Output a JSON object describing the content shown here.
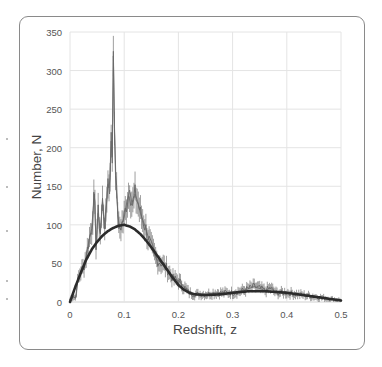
{
  "chart_data": {
    "type": "line",
    "title": "",
    "xlabel": "Redshift, z",
    "ylabel": "Number,  N",
    "xlim": [
      0,
      0.5
    ],
    "ylim": [
      0,
      350
    ],
    "x_ticks": [
      "0",
      "0.1",
      "0.2",
      "0.3",
      "0.4",
      "0.5"
    ],
    "y_ticks": [
      "0",
      "50",
      "100",
      "150",
      "200",
      "250",
      "300",
      "350"
    ],
    "grid": true,
    "legend": null,
    "series": [
      {
        "name": "Observed counts (histogram with error bars)",
        "style": "thin gray stepped line with error bars",
        "x": [
          0.0,
          0.005,
          0.01,
          0.015,
          0.02,
          0.025,
          0.03,
          0.035,
          0.04,
          0.045,
          0.048,
          0.052,
          0.056,
          0.06,
          0.065,
          0.07,
          0.073,
          0.076,
          0.078,
          0.08,
          0.082,
          0.085,
          0.088,
          0.09,
          0.095,
          0.1,
          0.105,
          0.11,
          0.115,
          0.12,
          0.125,
          0.13,
          0.135,
          0.14,
          0.15,
          0.16,
          0.17,
          0.18,
          0.19,
          0.2,
          0.21,
          0.22,
          0.23,
          0.25,
          0.27,
          0.3,
          0.32,
          0.34,
          0.36,
          0.37,
          0.38,
          0.4,
          0.42,
          0.44,
          0.46,
          0.48,
          0.5
        ],
        "values": [
          3,
          8,
          5,
          30,
          40,
          45,
          60,
          80,
          95,
          140,
          75,
          115,
          90,
          130,
          95,
          160,
          140,
          220,
          180,
          325,
          230,
          150,
          120,
          95,
          100,
          110,
          130,
          145,
          125,
          140,
          130,
          115,
          105,
          95,
          70,
          55,
          50,
          42,
          30,
          28,
          20,
          12,
          10,
          10,
          12,
          12,
          15,
          20,
          15,
          18,
          12,
          12,
          10,
          8,
          6,
          4,
          2
        ]
      },
      {
        "name": "Smooth fit",
        "style": "thick dark curve",
        "x": [
          0.0,
          0.01,
          0.02,
          0.03,
          0.04,
          0.05,
          0.06,
          0.07,
          0.08,
          0.09,
          0.1,
          0.11,
          0.12,
          0.13,
          0.14,
          0.15,
          0.16,
          0.17,
          0.18,
          0.19,
          0.2,
          0.21,
          0.22,
          0.23,
          0.25,
          0.28,
          0.3,
          0.33,
          0.36,
          0.4,
          0.43,
          0.46,
          0.5
        ],
        "values": [
          0,
          20,
          38,
          55,
          68,
          78,
          86,
          92,
          96,
          99,
          100,
          98,
          94,
          88,
          80,
          71,
          61,
          51,
          41,
          31,
          22,
          16,
          12,
          10,
          9,
          10,
          12,
          14,
          14,
          12,
          9,
          6,
          2
        ]
      }
    ]
  },
  "axes": {
    "xlabel": "Redshift, z",
    "ylabel": "Number,  N",
    "x_ticks": [
      "0",
      "0.1",
      "0.2",
      "0.3",
      "0.4",
      "0.5"
    ],
    "y_ticks": [
      "0",
      "50",
      "100",
      "150",
      "200",
      "250",
      "300",
      "350"
    ]
  },
  "colors": {
    "data_line": "#6a6a6a",
    "fit_line": "#2b2b2b",
    "grid": "#e4e4e4",
    "frame": "#8a8a8a",
    "tick_text": "#555555"
  }
}
